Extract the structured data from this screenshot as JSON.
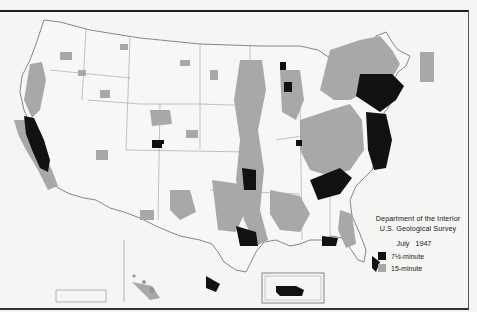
{
  "map": {
    "subject": "Topographic map coverage of the United States",
    "colors": {
      "background": "#f5f5f3",
      "outline": "#6a6a6a",
      "coverage_7_5": "#111111",
      "coverage_15": "#a8a8a8"
    }
  },
  "legend": {
    "agency_line1": "Department of the Interior",
    "agency_line2": "U.S. Geological Survey",
    "date": "July   1947",
    "items": [
      {
        "label": "7½-minute",
        "color": "#111111"
      },
      {
        "label": "15-minute",
        "color": "#a8a8a8"
      }
    ]
  },
  "insets": [
    {
      "name": "Alaska"
    },
    {
      "name": "Hawaii"
    },
    {
      "name": "Puerto Rico"
    }
  ]
}
